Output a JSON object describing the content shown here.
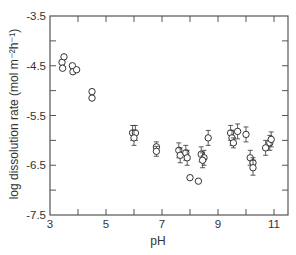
{
  "chart_data": {
    "type": "scatter",
    "title": "",
    "xlabel": "pH",
    "ylabel": "log dissolution rate (mol m⁻²h⁻¹)",
    "xlim": [
      3,
      11.5
    ],
    "ylim": [
      -7.5,
      -3.5
    ],
    "x_ticks": [
      3,
      5,
      7,
      9,
      11
    ],
    "x_minor_ticks": [
      4,
      6,
      8,
      10
    ],
    "y_ticks": [
      -3.5,
      -4.5,
      -5.5,
      -6.5,
      -7.5
    ],
    "y_minor_ticks": [
      -4.0,
      -5.0,
      -6.0,
      -7.0
    ],
    "x_tick_labels": [
      "3",
      "5",
      "7",
      "9",
      "11"
    ],
    "y_tick_labels": [
      "-3.5",
      "-4.5",
      "-5.5",
      "-6.5",
      "-7.5"
    ],
    "grid": false,
    "legend": null,
    "marker": "open-circle",
    "series": [
      {
        "name": "dissolution rate",
        "points": [
          {
            "x": 3.43,
            "y": -4.43,
            "err": 0
          },
          {
            "x": 3.5,
            "y": -4.32,
            "err": 0
          },
          {
            "x": 3.45,
            "y": -4.55,
            "err": 0
          },
          {
            "x": 3.8,
            "y": -4.5,
            "err": 0
          },
          {
            "x": 3.82,
            "y": -4.62,
            "err": 0
          },
          {
            "x": 3.95,
            "y": -4.58,
            "err": 0
          },
          {
            "x": 4.5,
            "y": -5.02,
            "err": 0
          },
          {
            "x": 4.5,
            "y": -5.15,
            "err": 0
          },
          {
            "x": 5.95,
            "y": -5.85,
            "err": 0.15
          },
          {
            "x": 6.05,
            "y": -5.85,
            "err": 0.15
          },
          {
            "x": 6.0,
            "y": -5.95,
            "err": 0.15
          },
          {
            "x": 6.8,
            "y": -6.13,
            "err": 0.1
          },
          {
            "x": 6.8,
            "y": -6.22,
            "err": 0.1
          },
          {
            "x": 7.6,
            "y": -6.2,
            "err": 0.15
          },
          {
            "x": 7.65,
            "y": -6.3,
            "err": 0.15
          },
          {
            "x": 7.85,
            "y": -6.25,
            "err": 0.15
          },
          {
            "x": 7.9,
            "y": -6.35,
            "err": 0.15
          },
          {
            "x": 8.0,
            "y": -6.75,
            "err": 0
          },
          {
            "x": 8.3,
            "y": -6.82,
            "err": 0
          },
          {
            "x": 8.4,
            "y": -6.28,
            "err": 0.15
          },
          {
            "x": 8.5,
            "y": -6.35,
            "err": 0.15
          },
          {
            "x": 8.45,
            "y": -6.4,
            "err": 0.15
          },
          {
            "x": 8.65,
            "y": -5.95,
            "err": 0.15
          },
          {
            "x": 9.45,
            "y": -5.85,
            "err": 0.15
          },
          {
            "x": 9.5,
            "y": -5.95,
            "err": 0.15
          },
          {
            "x": 9.55,
            "y": -6.05,
            "err": 0.1
          },
          {
            "x": 9.7,
            "y": -5.82,
            "err": 0.15
          },
          {
            "x": 10.0,
            "y": -5.88,
            "err": 0.15
          },
          {
            "x": 10.15,
            "y": -6.35,
            "err": 0.15
          },
          {
            "x": 10.25,
            "y": -6.45,
            "err": 0.1
          },
          {
            "x": 10.25,
            "y": -6.55,
            "err": 0.15
          },
          {
            "x": 10.7,
            "y": -6.15,
            "err": 0.15
          },
          {
            "x": 10.85,
            "y": -6.05,
            "err": 0.15
          },
          {
            "x": 10.9,
            "y": -5.98,
            "err": 0.15
          }
        ]
      }
    ]
  }
}
